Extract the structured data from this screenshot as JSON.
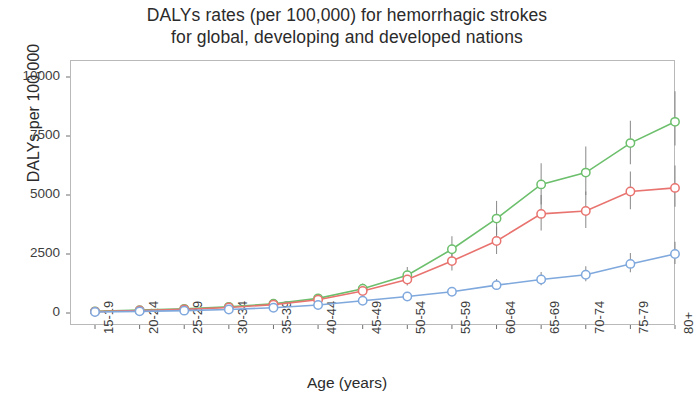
{
  "chart_data": {
    "type": "line",
    "title": "DALYs rates (per 100,000) for hemorrhagic strokes for global, developing and developed nations",
    "title_lines": [
      "DALYs rates (per 100,000) for hemorrhagic strokes",
      "for global, developing and developed nations"
    ],
    "xlabel": "Age (years)",
    "ylabel": "DALYs per 100,000",
    "ylim": [
      0,
      10600
    ],
    "yticks": [
      0,
      2500,
      5000,
      7500,
      10000
    ],
    "ytick_labels": [
      "0",
      "2500",
      "5000",
      "7500",
      "10000"
    ],
    "grid": false,
    "legend": "none",
    "error_bars": true,
    "categories": [
      "15-19",
      "20-24",
      "25-29",
      "30-34",
      "35-39",
      "40-44",
      "45-49",
      "50-54",
      "55-59",
      "60-64",
      "65-69",
      "70-74",
      "75-79",
      "80+"
    ],
    "series": [
      {
        "name": "developing",
        "color": "#6cbf6c",
        "marker": "circle-open",
        "values": [
          70,
          120,
          175,
          260,
          390,
          620,
          1030,
          1600,
          2700,
          4000,
          5450,
          5950,
          7200,
          8100
        ],
        "err_low": [
          50,
          95,
          140,
          210,
          315,
          500,
          840,
          1300,
          2200,
          3300,
          4600,
          5000,
          6300,
          7100
        ],
        "err_high": [
          95,
          155,
          215,
          320,
          480,
          760,
          1250,
          1950,
          3250,
          4750,
          6350,
          7050,
          8150,
          9400
        ]
      },
      {
        "name": "global",
        "color": "#e8736f",
        "marker": "circle-open",
        "values": [
          60,
          105,
          155,
          235,
          355,
          560,
          930,
          1420,
          2200,
          3050,
          4200,
          4320,
          5150,
          5300
        ],
        "err_low": [
          45,
          85,
          125,
          190,
          285,
          455,
          760,
          1160,
          1800,
          2500,
          3500,
          3600,
          4400,
          4500
        ],
        "err_high": [
          80,
          130,
          190,
          285,
          430,
          685,
          1130,
          1720,
          2650,
          3650,
          5000,
          5150,
          6000,
          6250
        ]
      },
      {
        "name": "developed",
        "color": "#7fa8dd",
        "marker": "circle-open",
        "values": [
          40,
          70,
          100,
          150,
          225,
          340,
          520,
          700,
          900,
          1180,
          1420,
          1620,
          2080,
          2500
        ],
        "err_low": [
          32,
          58,
          82,
          122,
          185,
          280,
          430,
          580,
          745,
          980,
          1180,
          1350,
          1730,
          2080
        ],
        "err_high": [
          52,
          88,
          125,
          188,
          280,
          420,
          640,
          860,
          1105,
          1440,
          1740,
          1980,
          2540,
          3020
        ]
      }
    ]
  },
  "axis": {
    "frame_color": "#b9b9b9",
    "tick_color": "#6e6e6e",
    "errorbar_color": "#808080"
  }
}
